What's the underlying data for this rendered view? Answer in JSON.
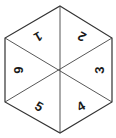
{
  "spinner": {
    "shape": "hexagon",
    "segments": [
      {
        "label": "1",
        "angle": 150
      },
      {
        "label": "2",
        "angle": 210
      },
      {
        "label": "3",
        "angle": 270
      },
      {
        "label": "4",
        "angle": 330
      },
      {
        "label": "5",
        "angle": 30
      },
      {
        "label": "6",
        "angle": 90
      }
    ],
    "colors": {
      "stroke": "#333333",
      "fill": "#ffffff",
      "text": "#1a1a1a"
    }
  }
}
